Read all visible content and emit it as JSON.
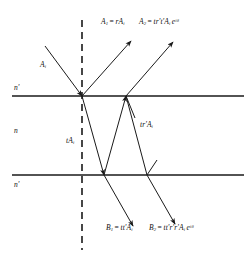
{
  "figure": {
    "background_color": "#ffffff",
    "line_color": "#1a1a1a"
  },
  "media": {
    "upper_index_label": "n'",
    "film_index_label": "n",
    "lower_index_label": "n'"
  },
  "rays": {
    "incident": {
      "label_prefix": "A",
      "label_sub": "i"
    },
    "reflected_first": {
      "name": "A",
      "sub": "1",
      "equals": "=",
      "expr_r": "r",
      "expr_A": "A",
      "expr_sub": "i"
    },
    "reflected_second": {
      "name": "A",
      "sub": "2",
      "equals": "=",
      "expr_t": "t",
      "expr_r": "r'",
      "expr_tp": "t'",
      "expr_A": "A",
      "expr_sub": "i",
      "expr_exp_base": "e",
      "expr_exp_power": "iδ"
    },
    "internal_transmitted": {
      "expr_t": "t",
      "expr_A": "A",
      "expr_sub": "i"
    },
    "internal_reflected": {
      "expr_t": "t",
      "expr_r": "r'",
      "expr_A": "A",
      "expr_sub": "i"
    },
    "transmitted_first": {
      "name": "B",
      "sub": "1",
      "equals": "=",
      "expr_t": "t",
      "expr_tp": "t'",
      "expr_A": "A",
      "expr_sub": "i"
    },
    "transmitted_second": {
      "name": "B",
      "sub": "2",
      "equals": "=",
      "expr_t": "t",
      "expr_tp": "t'",
      "expr_r1": "r'",
      "expr_r2": "r'",
      "expr_A": "A",
      "expr_sub": "i",
      "expr_exp_base": "e",
      "expr_exp_power": "iδ"
    }
  },
  "labels": {
    "top_label_1": "A₁ = rAᵢ",
    "top_label_2": "A₂ = tr't'Aᵢ eⁱᵟ",
    "mid_label": "tr'Aᵢ",
    "film_label": "tAᵢ",
    "bottom_label_1": "B₁ = tt'Aᵢ",
    "bottom_label_2": "B₂ = tt'r'r'Aᵢ eⁱᵟ"
  },
  "geometry": {
    "interface_top_y": 96,
    "interface_bottom_y": 175,
    "normal_x": 82,
    "normal_top_y": 20,
    "normal_bottom_y": 250
  }
}
